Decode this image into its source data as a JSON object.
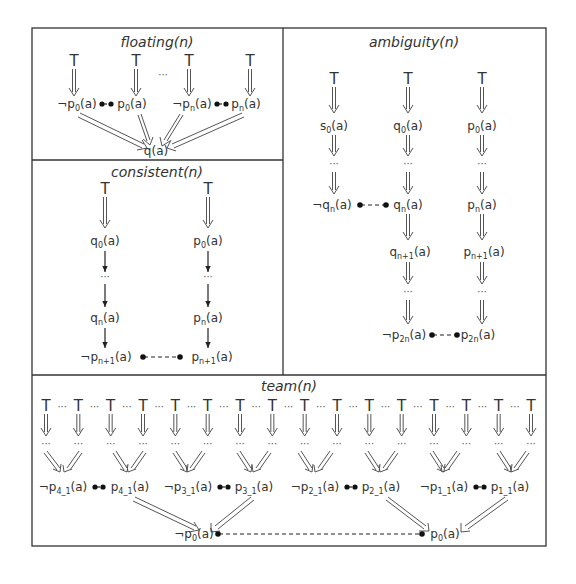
{
  "panels": {
    "floating": {
      "title": "floating(n)",
      "top_symbol": "T",
      "ellipsis": "···",
      "nodes": [
        {
          "neg": "¬",
          "base": "p",
          "sub": "0",
          "arg": "(a)"
        },
        {
          "neg": "",
          "base": "p",
          "sub": "0",
          "arg": "(a)"
        },
        {
          "neg": "¬",
          "base": "p",
          "sub": "n",
          "arg": "(a)"
        },
        {
          "neg": "",
          "base": "p",
          "sub": "n",
          "arg": "(a)"
        }
      ],
      "sink": "q(a)"
    },
    "consistent": {
      "title": "consistent(n)",
      "top_symbol": "T",
      "ellipsis": "···",
      "left_chain": [
        {
          "base": "q",
          "sub": "0",
          "arg": "(a)"
        },
        {
          "base": "q",
          "sub": "n",
          "arg": "(a)"
        }
      ],
      "right_chain": [
        {
          "base": "p",
          "sub": "0",
          "arg": "(a)"
        },
        {
          "base": "p",
          "sub": "n",
          "arg": "(a)"
        }
      ],
      "conflict_left": {
        "neg": "¬",
        "base": "p",
        "sub": "n+1",
        "arg": "(a)"
      },
      "conflict_right": {
        "neg": "",
        "base": "p",
        "sub": "n+1",
        "arg": "(a)"
      }
    },
    "ambiguity": {
      "title": "ambiguity(n)",
      "top_symbol": "T",
      "ellipsis": "···",
      "col1": [
        {
          "neg": "",
          "base": "s",
          "sub": "0",
          "arg": "(a)"
        },
        {
          "neg": "¬",
          "base": "q",
          "sub": "n",
          "arg": "(a)"
        }
      ],
      "col2": [
        {
          "neg": "",
          "base": "q",
          "sub": "0",
          "arg": "(a)"
        },
        {
          "neg": "",
          "base": "q",
          "sub": "n",
          "arg": "(a)"
        },
        {
          "neg": "",
          "base": "q",
          "sub": "n+1",
          "arg": "(a)"
        }
      ],
      "col3": [
        {
          "neg": "",
          "base": "p",
          "sub": "0",
          "arg": "(a)"
        },
        {
          "neg": "",
          "base": "p",
          "sub": "n",
          "arg": "(a)"
        },
        {
          "neg": "",
          "base": "p",
          "sub": "n+1",
          "arg": "(a)"
        }
      ],
      "conflict_left": {
        "neg": "¬",
        "base": "p",
        "sub": "2n",
        "arg": "(a)"
      },
      "conflict_right": {
        "neg": "",
        "base": "p",
        "sub": "2n",
        "arg": "(a)"
      }
    },
    "team": {
      "title": "team(n)",
      "top_symbol": "T",
      "ellipsis": "···",
      "top_count": 16,
      "nodes": [
        {
          "neg": "¬",
          "base": "p",
          "sub": "4_1",
          "arg": "(a)"
        },
        {
          "neg": "",
          "base": "p",
          "sub": "4_1",
          "arg": "(a)"
        },
        {
          "neg": "¬",
          "base": "p",
          "sub": "3_1",
          "arg": "(a)"
        },
        {
          "neg": "",
          "base": "p",
          "sub": "3_1",
          "arg": "(a)"
        },
        {
          "neg": "¬",
          "base": "p",
          "sub": "2_1",
          "arg": "(a)"
        },
        {
          "neg": "",
          "base": "p",
          "sub": "2_1",
          "arg": "(a)"
        },
        {
          "neg": "¬",
          "base": "p",
          "sub": "1_1",
          "arg": "(a)"
        },
        {
          "neg": "",
          "base": "p",
          "sub": "1_1",
          "arg": "(a)"
        }
      ],
      "sink_left": {
        "neg": "¬",
        "base": "p",
        "sub": "0",
        "arg": "(a)"
      },
      "sink_right": {
        "neg": "",
        "base": "p",
        "sub": "0",
        "arg": "(a)"
      }
    }
  }
}
